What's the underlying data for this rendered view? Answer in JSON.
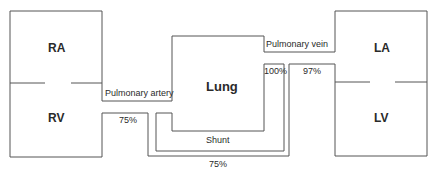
{
  "chambers": {
    "ra": "RA",
    "rv": "RV",
    "la": "LA",
    "lv": "LV"
  },
  "vessels": {
    "pulmonary_artery": "Pulmonary artery",
    "pulmonary_vein": "Pulmonary vein",
    "shunt": "Shunt"
  },
  "organ": {
    "lung": "Lung"
  },
  "saturations": {
    "rv_outflow": "75%",
    "shunt_return": "75%",
    "pulmonary_capillary": "100%",
    "systemic_arterial": "97%"
  },
  "colors": {
    "line": "#555555",
    "text": "#2a2a2a"
  }
}
